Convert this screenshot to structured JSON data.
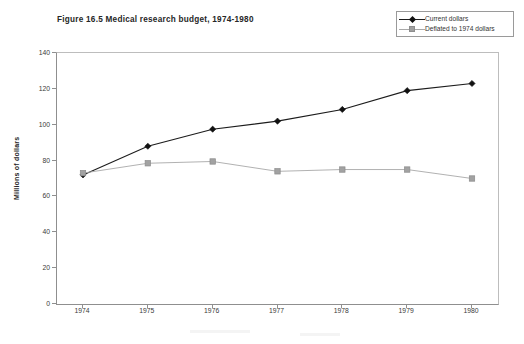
{
  "chart_data": {
    "type": "line",
    "title": "Figure 16.5 Medical research budget, 1974-1980",
    "xlabel": "",
    "ylabel": "Millions of dollars",
    "x": [
      1974,
      1975,
      1976,
      1977,
      1978,
      1979,
      1980
    ],
    "xtick_labels": [
      "1974",
      "1975",
      "1976",
      "1977",
      "1978",
      "1979",
      "1980"
    ],
    "ytick_labels": [
      "0",
      "20",
      "40",
      "60",
      "80",
      "100",
      "120",
      "140"
    ],
    "ytick_values": [
      0,
      20,
      40,
      60,
      80,
      100,
      120,
      140
    ],
    "ylim": [
      0,
      140
    ],
    "xlim": [
      1973.5,
      1980.5
    ],
    "grid": false,
    "legend_position": "top-right-outside",
    "series": [
      {
        "name": "Current dollars",
        "values": [
          72,
          88,
          97.5,
          102,
          108.5,
          119,
          123
        ],
        "color": "#1c1c1c",
        "marker": "diamond"
      },
      {
        "name": "Deflated to 1974 dollars",
        "values": [
          73,
          78.5,
          79.5,
          74,
          75,
          75,
          70
        ],
        "color": "#a8a8a8",
        "marker": "square"
      }
    ]
  },
  "legend": {
    "entries": [
      {
        "label": "Current dollars"
      },
      {
        "label": "Deflated to 1974 dollars"
      }
    ]
  }
}
